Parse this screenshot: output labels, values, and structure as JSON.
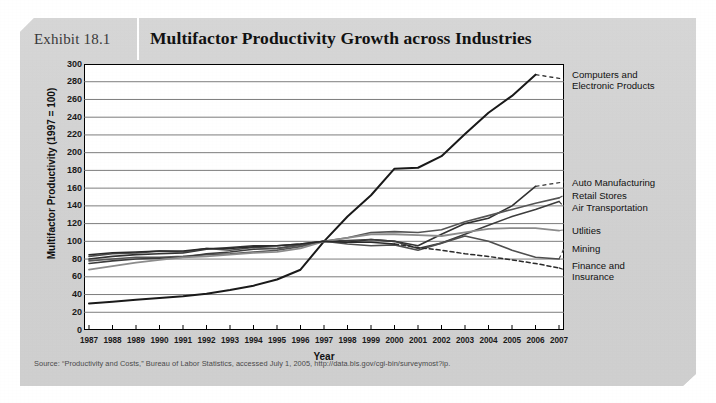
{
  "exhibit": {
    "number": "Exhibit 18.1",
    "title": "Multifactor Productivity Growth across Industries",
    "source": "Source: “Productivity and Costs,” Bureau of Labor Statistics, accessed July 1, 2005, http://data.bls.gov/cgi-bin/surveymost?ip.",
    "panel_color": "#d2d2d2",
    "plot_background": "#ffffff",
    "axis_color": "#000000"
  },
  "chart_data": {
    "type": "line",
    "title": "Multifactor Productivity Growth across Industries",
    "xlabel": "Year",
    "ylabel": "Multifactor Productivity (1997 = 100)",
    "xlim": [
      1987,
      2007
    ],
    "ylim": [
      0,
      300
    ],
    "ytick_step": 20,
    "yticks": [
      0,
      20,
      40,
      60,
      80,
      100,
      120,
      140,
      160,
      180,
      200,
      220,
      240,
      260,
      280,
      300
    ],
    "grid": "horizontal",
    "legend_position": "right-inline-labels",
    "categories": [
      1987,
      1988,
      1989,
      1990,
      1991,
      1992,
      1993,
      1994,
      1995,
      1996,
      1997,
      1998,
      1999,
      2000,
      2001,
      2002,
      2003,
      2004,
      2005,
      2006,
      2007
    ],
    "xtick_labels": [
      "1987",
      "1988",
      "1989",
      "1990",
      "1991",
      "1992",
      "1993",
      "1994",
      "1995",
      "1996",
      "1997",
      "1998",
      "1999",
      "2000",
      "2001",
      "2002",
      "2003",
      "2004",
      "2005",
      "2006",
      "2007"
    ],
    "series": [
      {
        "name": "Computers and Electronic Products",
        "label": "Computers and\nElectronic Products",
        "label_line1": "Computers and",
        "label_line2": "Electronic Products",
        "color": "#1a1a1a",
        "width": 2.0,
        "label_y_value": 283,
        "last_solid_year": 2006,
        "values": [
          30,
          32,
          34,
          36,
          38,
          41,
          45,
          50,
          57,
          68,
          100,
          128,
          152,
          182,
          183,
          196,
          221,
          245,
          264,
          288,
          null
        ]
      },
      {
        "name": "Auto Manufacturing",
        "label": "Auto Manufacturing",
        "label_line1": "Auto Manufacturing",
        "color": "#333333",
        "width": 1.6,
        "label_y_value": 167,
        "last_solid_year": 2006,
        "values": [
          80,
          83,
          85,
          86,
          87,
          91,
          93,
          95,
          95,
          97,
          100,
          99,
          102,
          100,
          95,
          108,
          120,
          126,
          140,
          162,
          null
        ]
      },
      {
        "name": "Retail Stores",
        "label": "Retail Stores",
        "label_line1": "Retail Stores",
        "color": "#555555",
        "width": 1.6,
        "label_y_value": 152,
        "last_solid_year": 2007,
        "values": [
          78,
          80,
          82,
          82,
          83,
          85,
          86,
          88,
          90,
          94,
          100,
          104,
          110,
          111,
          110,
          113,
          122,
          129,
          136,
          143,
          149
        ]
      },
      {
        "name": "Air Transportation",
        "label": "Air Transportation",
        "label_line1": "Air Transportation",
        "color": "#3d3d3d",
        "width": 1.6,
        "label_y_value": 139,
        "last_solid_year": 2007,
        "values": [
          75,
          78,
          80,
          81,
          82,
          86,
          88,
          91,
          92,
          96,
          100,
          101,
          102,
          100,
          92,
          98,
          108,
          118,
          128,
          136,
          145
        ]
      },
      {
        "name": "Utlities",
        "label": "Utlities",
        "label_line1": "Utlities",
        "color": "#8c8c8c",
        "width": 1.8,
        "label_y_value": 113,
        "last_solid_year": 2007,
        "values": [
          68,
          72,
          76,
          79,
          82,
          83,
          85,
          87,
          88,
          92,
          100,
          104,
          108,
          108,
          107,
          106,
          110,
          114,
          115,
          115,
          112
        ]
      },
      {
        "name": "Mining",
        "label": "Mining",
        "label_line1": "Mining",
        "color": "#4f4f4f",
        "width": 1.6,
        "label_y_value": 92,
        "last_solid_year": 2007,
        "values": [
          83,
          86,
          87,
          89,
          88,
          92,
          90,
          93,
          92,
          96,
          100,
          97,
          95,
          96,
          90,
          98,
          106,
          100,
          90,
          82,
          80
        ]
      },
      {
        "name": "Finance and Insurance",
        "label": "Finance and\nInsurance",
        "label_line1": "Finance and",
        "label_line2": "Insurance",
        "color": "#2a2a2a",
        "width": 1.5,
        "dashed_from_year": 2000,
        "label_y_value": 68,
        "last_solid_year": 2007,
        "values": [
          85,
          87,
          88,
          89,
          89,
          92,
          92,
          94,
          95,
          97,
          100,
          99,
          99,
          97,
          93,
          90,
          86,
          83,
          79,
          75,
          70
        ]
      }
    ]
  }
}
